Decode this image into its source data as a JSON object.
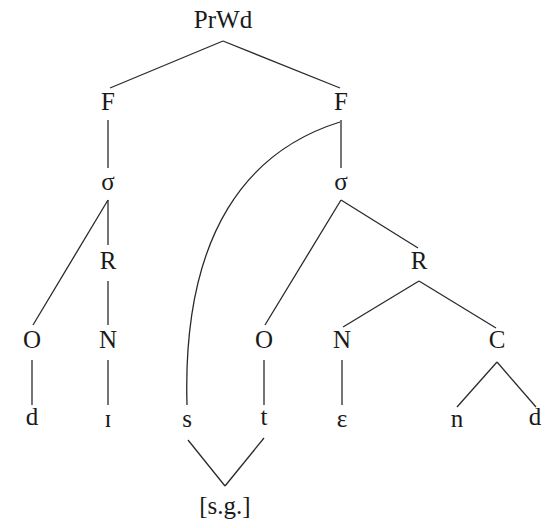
{
  "diagram": {
    "type": "prosodic-tree",
    "root": {
      "id": "prwd",
      "label": "PrWd",
      "x": 223,
      "y": 22
    },
    "nodes": [
      {
        "id": "prwd",
        "label": "PrWd",
        "x": 223,
        "y": 22
      },
      {
        "id": "f1",
        "label": "F",
        "x": 108,
        "y": 104
      },
      {
        "id": "f2",
        "label": "F",
        "x": 341,
        "y": 104
      },
      {
        "id": "syl1",
        "label": "σ",
        "x": 108,
        "y": 184
      },
      {
        "id": "syl2",
        "label": "σ",
        "x": 341,
        "y": 184
      },
      {
        "id": "r1",
        "label": "R",
        "x": 108,
        "y": 263
      },
      {
        "id": "r2",
        "label": "R",
        "x": 419,
        "y": 263
      },
      {
        "id": "o1",
        "label": "O",
        "x": 32,
        "y": 342
      },
      {
        "id": "n1",
        "label": "N",
        "x": 108,
        "y": 342
      },
      {
        "id": "o2",
        "label": "O",
        "x": 264,
        "y": 342
      },
      {
        "id": "n2",
        "label": "N",
        "x": 342,
        "y": 342
      },
      {
        "id": "c1",
        "label": "C",
        "x": 497,
        "y": 342
      }
    ],
    "segments": [
      {
        "id": "seg-d1",
        "label": "d",
        "x": 32,
        "y": 419
      },
      {
        "id": "seg-i",
        "label": "ɪ",
        "x": 108,
        "y": 421
      },
      {
        "id": "seg-s",
        "label": "s",
        "x": 187,
        "y": 421
      },
      {
        "id": "seg-t",
        "label": "t",
        "x": 264,
        "y": 419
      },
      {
        "id": "seg-e",
        "label": "ɛ",
        "x": 342,
        "y": 421
      },
      {
        "id": "seg-n",
        "label": "n",
        "x": 457,
        "y": 421
      },
      {
        "id": "seg-d2",
        "label": "d",
        "x": 535,
        "y": 419
      }
    ],
    "feature": {
      "id": "spread-glottis",
      "label": "[s.g.]",
      "x": 225,
      "y": 508
    },
    "edges": [
      {
        "from": "prwd",
        "to": "f1",
        "x1": 223,
        "y1": 41,
        "x2": 110,
        "y2": 88
      },
      {
        "from": "prwd",
        "to": "f2",
        "x1": 223,
        "y1": 41,
        "x2": 340,
        "y2": 88
      },
      {
        "from": "f1",
        "to": "syl1",
        "x1": 108,
        "y1": 120,
        "x2": 108,
        "y2": 168
      },
      {
        "from": "f2",
        "to": "syl2",
        "x1": 341,
        "y1": 120,
        "x2": 341,
        "y2": 168
      },
      {
        "from": "syl1",
        "to": "r1",
        "x1": 108,
        "y1": 200,
        "x2": 108,
        "y2": 245
      },
      {
        "from": "syl1",
        "to": "o1",
        "x1": 108,
        "y1": 200,
        "x2": 33,
        "y2": 325
      },
      {
        "from": "r1",
        "to": "n1",
        "x1": 108,
        "y1": 281,
        "x2": 108,
        "y2": 325
      },
      {
        "from": "syl2",
        "to": "o2",
        "x1": 341,
        "y1": 200,
        "x2": 265,
        "y2": 325
      },
      {
        "from": "syl2",
        "to": "r2",
        "x1": 341,
        "y1": 200,
        "x2": 418,
        "y2": 248
      },
      {
        "from": "r2",
        "to": "n2",
        "x1": 419,
        "y1": 281,
        "x2": 343,
        "y2": 327
      },
      {
        "from": "r2",
        "to": "c1",
        "x1": 419,
        "y1": 281,
        "x2": 496,
        "y2": 328
      },
      {
        "from": "o1",
        "to": "seg-d1",
        "x1": 32,
        "y1": 360,
        "x2": 32,
        "y2": 405
      },
      {
        "from": "n1",
        "to": "seg-i",
        "x1": 108,
        "y1": 360,
        "x2": 108,
        "y2": 405
      },
      {
        "from": "o2",
        "to": "seg-t",
        "x1": 264,
        "y1": 360,
        "x2": 264,
        "y2": 405
      },
      {
        "from": "n2",
        "to": "seg-e",
        "x1": 342,
        "y1": 360,
        "x2": 342,
        "y2": 405
      },
      {
        "from": "c1",
        "to": "seg-n",
        "x1": 497,
        "y1": 362,
        "x2": 457,
        "y2": 407
      },
      {
        "from": "c1",
        "to": "seg-d2",
        "x1": 497,
        "y1": 362,
        "x2": 536,
        "y2": 407
      },
      {
        "from": "seg-s",
        "to": "spread-glottis",
        "x1": 188,
        "y1": 440,
        "x2": 225,
        "y2": 486
      },
      {
        "from": "seg-t",
        "to": "spread-glottis",
        "x1": 264,
        "y1": 438,
        "x2": 225,
        "y2": 486
      }
    ],
    "curved_association": {
      "from": "f2",
      "to": "seg-s",
      "path": "M 340 122 C 250 150, 182 230, 187 405"
    }
  }
}
